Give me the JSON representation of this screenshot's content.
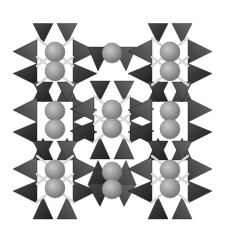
{
  "figure": {
    "title": "",
    "width": 226,
    "height": 240,
    "colors": {
      "background": "#ffffff",
      "tetra_dark": "#2e2e2e",
      "tetra_mid": "#555555",
      "tetra_light": "#7a7a7a",
      "sphere_fill": "#9a9a9a",
      "sphere_highlight": "#c8c8c8",
      "sphere_shade": "#6e6e6e",
      "bond": "#d6d6d6"
    },
    "sphere_radius": 10,
    "clusters": [
      {
        "id": "upper-left",
        "cx": 55,
        "spheres": [
          52,
          71
        ],
        "bonds": true
      },
      {
        "id": "top-center",
        "cx": 112,
        "spheres": [
          53
        ],
        "bonds": false
      },
      {
        "id": "upper-right",
        "cx": 170,
        "spheres": [
          52,
          71
        ],
        "bonds": true
      },
      {
        "id": "middle-left",
        "cx": 55,
        "spheres": [
          111,
          129
        ],
        "bonds": false
      },
      {
        "id": "middle-center",
        "cx": 112,
        "spheres": [
          110,
          128
        ],
        "bonds": true
      },
      {
        "id": "middle-right",
        "cx": 170,
        "spheres": [
          111,
          129
        ],
        "bonds": false
      },
      {
        "id": "lower-left",
        "cx": 55,
        "spheres": [
          170,
          188
        ],
        "bonds": true
      },
      {
        "id": "lower-center",
        "cx": 112,
        "spheres": [
          172,
          189
        ],
        "bonds": false
      },
      {
        "id": "lower-right",
        "cx": 170,
        "spheres": [
          170,
          188
        ],
        "bonds": true
      }
    ]
  }
}
